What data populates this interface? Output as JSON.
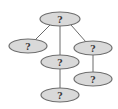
{
  "diagram": {
    "type": "tree",
    "colors": {
      "node_fill": "#d9d9d9",
      "node_stroke": "#6e6e6e",
      "edge": "#6b6b6b",
      "label": "#3a3a3a"
    },
    "nodes": [
      {
        "id": "root",
        "label": "?",
        "cx": 60,
        "cy": 19,
        "rx": 20,
        "ry": 7
      },
      {
        "id": "left",
        "label": "?",
        "cx": 28,
        "cy": 46,
        "rx": 19,
        "ry": 7
      },
      {
        "id": "middle",
        "label": "?",
        "cx": 60,
        "cy": 62,
        "rx": 19,
        "ry": 7
      },
      {
        "id": "right",
        "label": "?",
        "cx": 93,
        "cy": 48,
        "rx": 19,
        "ry": 7
      },
      {
        "id": "middle-child",
        "label": "?",
        "cx": 60,
        "cy": 95,
        "rx": 19,
        "ry": 7
      },
      {
        "id": "right-child",
        "label": "?",
        "cx": 93,
        "cy": 79,
        "rx": 19,
        "ry": 7
      }
    ],
    "edges": [
      {
        "from": "root",
        "to": "left"
      },
      {
        "from": "root",
        "to": "middle"
      },
      {
        "from": "root",
        "to": "right"
      },
      {
        "from": "middle",
        "to": "middle-child"
      },
      {
        "from": "right",
        "to": "right-child"
      }
    ]
  }
}
